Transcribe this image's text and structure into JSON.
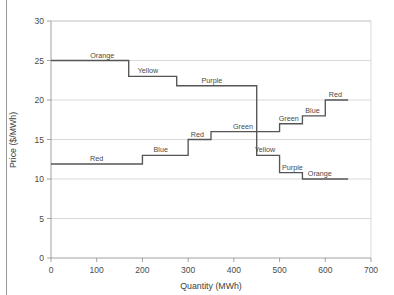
{
  "chart_data": {
    "type": "line",
    "title": "",
    "xlabel": "Quantity (MWh)",
    "ylabel": "Price ($/MWh)",
    "xlim": [
      0,
      700
    ],
    "ylim": [
      0,
      30
    ],
    "xticks": [
      0,
      100,
      200,
      300,
      400,
      500,
      600,
      700
    ],
    "yticks": [
      0,
      5,
      10,
      15,
      20,
      25,
      30
    ],
    "xtick_labels": [
      "0",
      "100",
      "200",
      "300",
      "400",
      "500",
      "600",
      "700"
    ],
    "ytick_labels": [
      "0",
      "5",
      "10",
      "15",
      "20",
      "25",
      "30"
    ],
    "grid": "horizontal",
    "legend": "none",
    "series": [
      {
        "name": "demand-curve",
        "kind": "step-decreasing",
        "steps": [
          {
            "label": "Orange",
            "x_start": 0,
            "x_end": 170,
            "price": 25.0
          },
          {
            "label": "Yellow",
            "x_start": 170,
            "x_end": 275,
            "price": 23.0
          },
          {
            "label": "Purple",
            "x_start": 275,
            "x_end": 450,
            "price": 21.8
          },
          {
            "label": "Yellow",
            "x_start": 450,
            "x_end": 500,
            "price": 13.0
          },
          {
            "label": "Purple",
            "x_start": 500,
            "x_end": 550,
            "price": 10.8
          },
          {
            "label": "Orange",
            "x_start": 550,
            "x_end": 650,
            "price": 10.0
          }
        ]
      },
      {
        "name": "supply-curve",
        "kind": "step-increasing",
        "steps": [
          {
            "label": "Red",
            "x_start": 0,
            "x_end": 200,
            "price": 11.9
          },
          {
            "label": "Blue",
            "x_start": 200,
            "x_end": 300,
            "price": 13.0
          },
          {
            "label": "Red",
            "x_start": 300,
            "x_end": 350,
            "price": 15.0
          },
          {
            "label": "Green",
            "x_start": 350,
            "x_end": 500,
            "price": 16.0
          },
          {
            "label": "Green",
            "x_start": 500,
            "x_end": 550,
            "price": 17.0
          },
          {
            "label": "Blue",
            "x_start": 550,
            "x_end": 600,
            "price": 18.0
          },
          {
            "label": "Red",
            "x_start": 600,
            "x_end": 650,
            "price": 20.0
          }
        ]
      }
    ],
    "annotations": [
      {
        "text": "Orange",
        "x": 112,
        "y": 25.0,
        "anchor": "curve-demand-1"
      },
      {
        "text": "Yellow",
        "x": 212,
        "y": 23.0,
        "anchor": "curve-demand-2"
      },
      {
        "text": "Purple",
        "x": 352,
        "y": 21.8,
        "anchor": "curve-demand-3"
      },
      {
        "text": "Yellow",
        "x": 468,
        "y": 13.0,
        "anchor": "curve-demand-4"
      },
      {
        "text": "Purple",
        "x": 528,
        "y": 10.8,
        "anchor": "curve-demand-5"
      },
      {
        "text": "Orange",
        "x": 588,
        "y": 10.0,
        "anchor": "curve-demand-6"
      },
      {
        "text": "Red",
        "x": 100,
        "y": 11.9,
        "anchor": "curve-supply-1"
      },
      {
        "text": "Blue",
        "x": 240,
        "y": 13.0,
        "anchor": "curve-supply-2"
      },
      {
        "text": "Red",
        "x": 320,
        "y": 15.0,
        "anchor": "curve-supply-3"
      },
      {
        "text": "Green",
        "x": 420,
        "y": 16.0,
        "anchor": "curve-supply-4"
      },
      {
        "text": "Green",
        "x": 520,
        "y": 17.0,
        "anchor": "curve-supply-5"
      },
      {
        "text": "Blue",
        "x": 572,
        "y": 18.0,
        "anchor": "curve-supply-6"
      },
      {
        "text": "Red",
        "x": 622,
        "y": 20.0,
        "anchor": "curve-supply-7"
      }
    ],
    "colors": {
      "curve": "#555555",
      "gridline": "#c9c9c9",
      "axis": "#8c8c8c",
      "text": "#4a4a4a",
      "background": "#ffffff"
    }
  }
}
